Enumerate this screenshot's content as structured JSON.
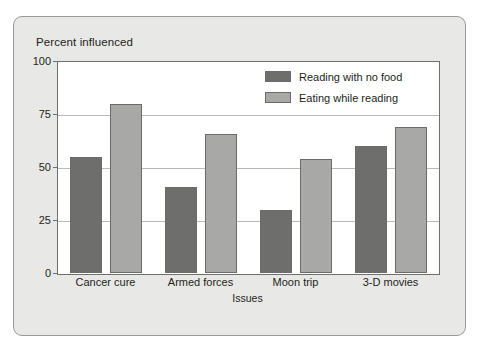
{
  "chart_data": {
    "type": "bar",
    "title": "Percent influenced",
    "xlabel": "Issues",
    "ylabel": "",
    "categories": [
      "Cancer cure",
      "Armed forces",
      "Moon trip",
      "3-D movies"
    ],
    "series": [
      {
        "name": "Reading with no food",
        "color": "#6e6e6c",
        "values": [
          55,
          41,
          30,
          60
        ]
      },
      {
        "name": "Eating while reading",
        "color": "#a8a8a6",
        "values": [
          80,
          66,
          54,
          69
        ]
      }
    ],
    "ylim": [
      0,
      100
    ],
    "yticks": [
      0,
      25,
      50,
      75,
      100
    ],
    "ytick_labels": [
      "0",
      "25",
      "50",
      "75",
      "100"
    ],
    "grid": true,
    "legend_position": "top-right"
  },
  "legend": {
    "items": [
      {
        "label": "Reading with no food",
        "swatch": "dark"
      },
      {
        "label": "Eating while reading",
        "swatch": "light"
      }
    ]
  }
}
